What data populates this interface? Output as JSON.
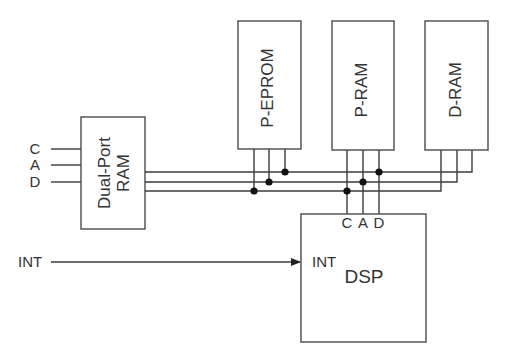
{
  "diagram": {
    "colors": {
      "line": "#3c3c3c",
      "box_border": "#4a4a4a",
      "junction": "#111111",
      "text": "#333333",
      "background": "#ffffff"
    },
    "blocks": {
      "dual_port_ram": {
        "label_line1": "Dual-Port",
        "label_line2": "RAM"
      },
      "p_eprom": {
        "label": "P-EPROM"
      },
      "p_ram": {
        "label": "P-RAM"
      },
      "d_ram": {
        "label": "D-RAM"
      },
      "dsp": {
        "label": "DSP",
        "int_pin": "INT",
        "pins": [
          "C",
          "A",
          "D"
        ]
      }
    },
    "inputs": {
      "bus_signals": [
        "C",
        "A",
        "D"
      ],
      "interrupt": "INT"
    }
  }
}
